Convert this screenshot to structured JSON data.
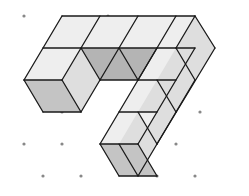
{
  "diagram": {
    "title": "",
    "colors": {
      "top": "#eeeeee",
      "left": "#c4c4c4",
      "right": "#dedede",
      "dark": "#b4b4b4",
      "edge": "#1a1a1a",
      "dot": "#888888"
    },
    "dots": [
      [
        24,
        16
      ],
      [
        62,
        112
      ],
      [
        24,
        144
      ],
      [
        62,
        144
      ],
      [
        43,
        176
      ],
      [
        81,
        176
      ],
      [
        108,
        16
      ],
      [
        200,
        112
      ],
      [
        176,
        144
      ],
      [
        157,
        176
      ],
      [
        195,
        176
      ]
    ],
    "faces": [
      {
        "c": "top",
        "p": [
          [
            62,
            16
          ],
          [
            100,
            16
          ],
          [
            81,
            48
          ],
          [
            43,
            48
          ]
        ]
      },
      {
        "c": "top",
        "p": [
          [
            100,
            16
          ],
          [
            138,
            16
          ],
          [
            119,
            48
          ],
          [
            81,
            48
          ]
        ]
      },
      {
        "c": "top",
        "p": [
          [
            138,
            16
          ],
          [
            176,
            16
          ],
          [
            157,
            48
          ],
          [
            119,
            48
          ]
        ]
      },
      {
        "c": "top",
        "p": [
          [
            176,
            16
          ],
          [
            195,
            16
          ],
          [
            176,
            48
          ],
          [
            157,
            48
          ]
        ]
      },
      {
        "c": "top",
        "p": [
          [
            43,
            48
          ],
          [
            81,
            48
          ],
          [
            62,
            80
          ],
          [
            24,
            80
          ]
        ]
      },
      {
        "c": "right",
        "p": [
          [
            81,
            48
          ],
          [
            100,
            80
          ],
          [
            81,
            112
          ],
          [
            62,
            80
          ]
        ]
      },
      {
        "c": "left",
        "p": [
          [
            24,
            80
          ],
          [
            62,
            80
          ],
          [
            81,
            112
          ],
          [
            43,
            112
          ]
        ]
      },
      {
        "c": "dark",
        "p": [
          [
            81,
            48
          ],
          [
            119,
            48
          ],
          [
            138,
            80
          ],
          [
            100,
            80
          ]
        ]
      },
      {
        "c": "dark",
        "p": [
          [
            119,
            48
          ],
          [
            157,
            48
          ],
          [
            138,
            80
          ]
        ]
      },
      {
        "c": "top",
        "p": [
          [
            157,
            48
          ],
          [
            138,
            80
          ],
          [
            119,
            112
          ],
          [
            157,
            112
          ],
          [
            176,
            80
          ],
          [
            195,
            48
          ]
        ]
      },
      {
        "c": "right",
        "p": [
          [
            195,
            16
          ],
          [
            215,
            48
          ],
          [
            195,
            80
          ],
          [
            176,
            48
          ]
        ]
      },
      {
        "c": "right",
        "p": [
          [
            176,
            48
          ],
          [
            195,
            80
          ],
          [
            176,
            112
          ],
          [
            157,
            80
          ]
        ]
      },
      {
        "c": "right",
        "p": [
          [
            157,
            80
          ],
          [
            176,
            112
          ],
          [
            157,
            144
          ],
          [
            138,
            112
          ]
        ]
      },
      {
        "c": "top",
        "p": [
          [
            119,
            112
          ],
          [
            157,
            112
          ],
          [
            138,
            144
          ],
          [
            100,
            144
          ]
        ]
      },
      {
        "c": "right",
        "p": [
          [
            138,
            112
          ],
          [
            157,
            144
          ],
          [
            138,
            176
          ],
          [
            119,
            144
          ]
        ]
      },
      {
        "c": "left",
        "p": [
          [
            100,
            144
          ],
          [
            138,
            144
          ],
          [
            157,
            176
          ],
          [
            119,
            176
          ]
        ]
      }
    ],
    "edges": [
      [
        [
          62,
          16
        ],
        [
          195,
          16
        ]
      ],
      [
        [
          195,
          16
        ],
        [
          215,
          48
        ]
      ],
      [
        [
          215,
          48
        ],
        [
          157,
          144
        ]
      ],
      [
        [
          157,
          144
        ],
        [
          138,
          176
        ]
      ],
      [
        [
          43,
          48
        ],
        [
          195,
          48
        ]
      ],
      [
        [
          24,
          80
        ],
        [
          62,
          80
        ]
      ],
      [
        [
          100,
          80
        ],
        [
          176,
          80
        ]
      ],
      [
        [
          62,
          16
        ],
        [
          24,
          80
        ]
      ],
      [
        [
          100,
          16
        ],
        [
          62,
          80
        ]
      ],
      [
        [
          138,
          16
        ],
        [
          100,
          80
        ]
      ],
      [
        [
          176,
          16
        ],
        [
          138,
          80
        ]
      ],
      [
        [
          195,
          16
        ],
        [
          176,
          48
        ]
      ],
      [
        [
          24,
          80
        ],
        [
          43,
          112
        ]
      ],
      [
        [
          43,
          112
        ],
        [
          81,
          112
        ]
      ],
      [
        [
          81,
          48
        ],
        [
          100,
          80
        ]
      ],
      [
        [
          100,
          80
        ],
        [
          81,
          112
        ]
      ],
      [
        [
          62,
          80
        ],
        [
          81,
          112
        ]
      ],
      [
        [
          119,
          48
        ],
        [
          138,
          80
        ]
      ],
      [
        [
          157,
          48
        ],
        [
          100,
          144
        ]
      ],
      [
        [
          195,
          48
        ],
        [
          138,
          144
        ]
      ],
      [
        [
          176,
          48
        ],
        [
          195,
          80
        ]
      ],
      [
        [
          157,
          80
        ],
        [
          176,
          112
        ]
      ],
      [
        [
          138,
          112
        ],
        [
          157,
          144
        ]
      ],
      [
        [
          119,
          112
        ],
        [
          157,
          112
        ]
      ],
      [
        [
          100,
          144
        ],
        [
          138,
          144
        ]
      ],
      [
        [
          100,
          144
        ],
        [
          119,
          176
        ]
      ],
      [
        [
          119,
          176
        ],
        [
          157,
          176
        ]
      ],
      [
        [
          138,
          144
        ],
        [
          157,
          176
        ]
      ],
      [
        [
          119,
          144
        ],
        [
          138,
          176
        ]
      ],
      [
        [
          195,
          80
        ],
        [
          176,
          112
        ]
      ],
      [
        [
          176,
          112
        ],
        [
          157,
          144
        ]
      ]
    ]
  }
}
